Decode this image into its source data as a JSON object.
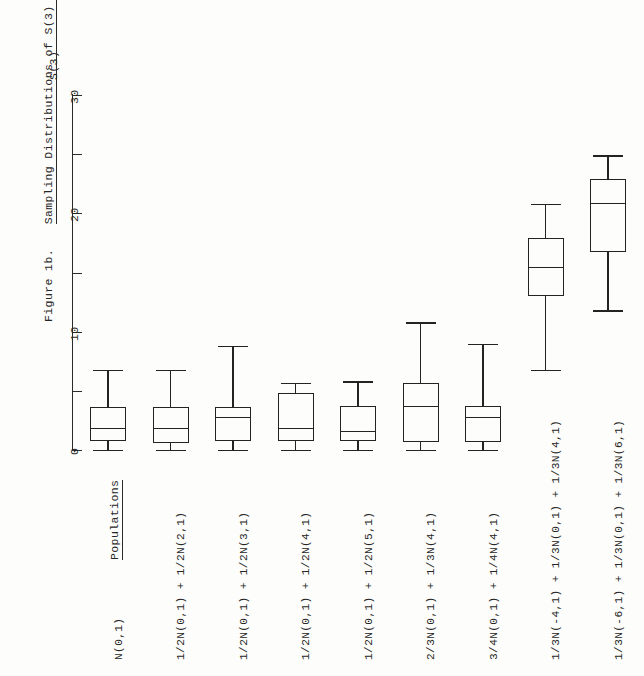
{
  "figure": {
    "caption_label": "Figure 1b.",
    "caption_title": "Sampling Distributions of S(3) when N = 100",
    "axis_title": "S(3)",
    "populations_header": "Populations"
  },
  "chart_data": {
    "type": "box",
    "title": "Figure 1b.  Sampling Distributions of S(3) when N = 100",
    "xlabel": "Populations",
    "ylabel": "S(3)",
    "orientation": "vertical-boxes-rotated-page",
    "ylim": [
      0,
      30
    ],
    "yticks": [
      0,
      5,
      10,
      15,
      20,
      25,
      30
    ],
    "ytick_labels": [
      "0",
      "",
      "10",
      "",
      "20",
      "",
      "30"
    ],
    "grid": false,
    "legend": "none",
    "categories": [
      "N(0,1)",
      "1/2N(0,1) + 1/2N(2,1)",
      "1/2N(0,1) + 1/2N(3,1)",
      "1/2N(0,1) + 1/2N(4,1)",
      "1/2N(0,1) + 1/2N(5,1)",
      "2/3N(0,1) + 1/3N(4,1)",
      "3/4N(0,1) + 1/4N(4,1)",
      "1/3N(-4,1) + 1/3N(0,1) + 1/3N(4,1)",
      "1/3N(-6,1) + 1/3N(0,1) + 1/3N(6,1)"
    ],
    "boxes": [
      {
        "label": "N(0,1)",
        "whisker_low": 0.0,
        "q1": 0.8,
        "median": 1.9,
        "q3": 3.6,
        "whisker_high": 6.8
      },
      {
        "label": "1/2N(0,1) + 1/2N(2,1)",
        "whisker_low": 0.0,
        "q1": 0.6,
        "median": 1.9,
        "q3": 3.6,
        "whisker_high": 6.8
      },
      {
        "label": "1/2N(0,1) + 1/2N(3,1)",
        "whisker_low": 0.0,
        "q1": 0.8,
        "median": 2.8,
        "q3": 3.6,
        "whisker_high": 8.8
      },
      {
        "label": "1/2N(0,1) + 1/2N(4,1)",
        "whisker_low": 0.0,
        "q1": 0.8,
        "median": 1.9,
        "q3": 4.8,
        "whisker_high": 5.7
      },
      {
        "label": "1/2N(0,1) + 1/2N(5,1)",
        "whisker_low": 0.0,
        "q1": 0.8,
        "median": 1.6,
        "q3": 3.7,
        "whisker_high": 5.8
      },
      {
        "label": "2/3N(0,1) + 1/3N(4,1)",
        "whisker_low": 0.0,
        "q1": 0.7,
        "median": 3.7,
        "q3": 5.7,
        "whisker_high": 10.8
      },
      {
        "label": "3/4N(0,1) + 1/4N(4,1)",
        "whisker_low": 0.0,
        "q1": 0.7,
        "median": 2.8,
        "q3": 3.7,
        "whisker_high": 9.0
      },
      {
        "label": "1/3N(-4,1) + 1/3N(0,1) + 1/3N(4,1)",
        "whisker_low": 6.8,
        "q1": 13.0,
        "median": 15.5,
        "q3": 17.9,
        "whisker_high": 20.8
      },
      {
        "label": "1/3N(-6,1) + 1/3N(0,1) + 1/3N(6,1)",
        "whisker_low": 11.8,
        "q1": 16.7,
        "median": 20.9,
        "q3": 22.9,
        "whisker_high": 24.9
      }
    ]
  }
}
